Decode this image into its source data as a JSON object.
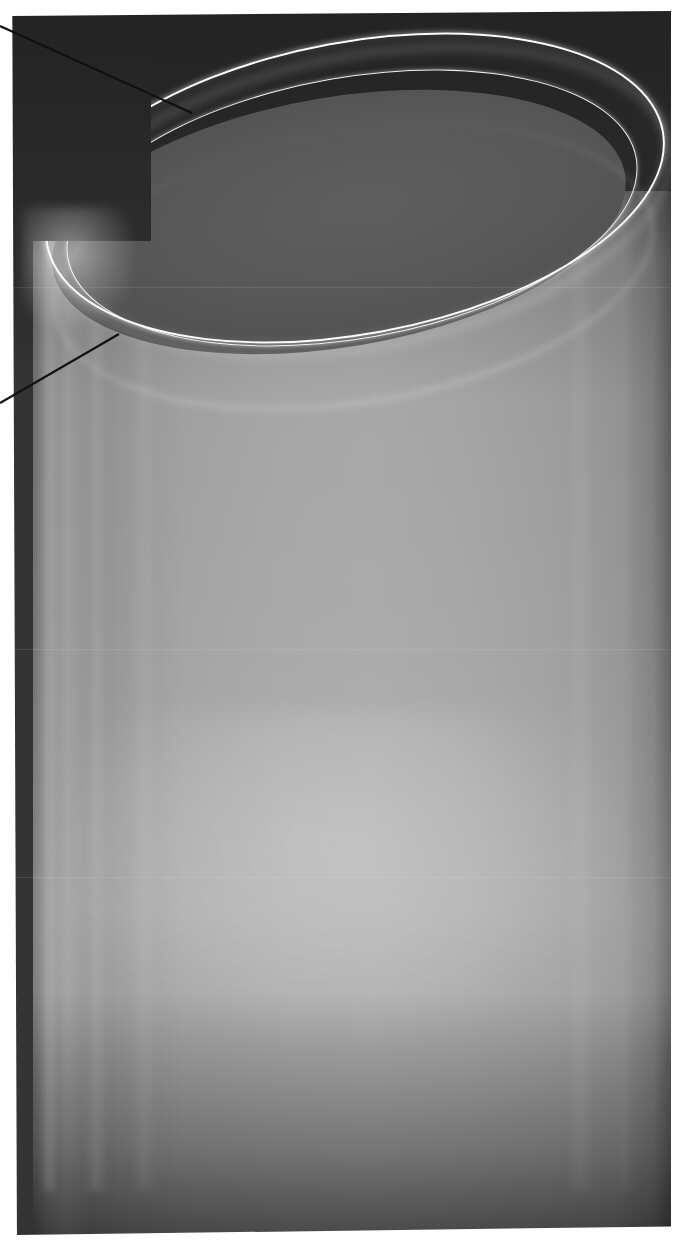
{
  "figure": {
    "kind": "grayscale-photograph",
    "caption": "",
    "orientation": "portrait",
    "width_px": 679,
    "height_px": 1245
  },
  "photo": {
    "plate": {
      "left_px": 11,
      "top_px": 11,
      "width_px": 660,
      "height_px": 1224,
      "page_background": "#ffffff"
    },
    "palette": {
      "page_white": "#ffffff",
      "backdrop_dark": "#232323",
      "backdrop_upper": "#2b2b2b",
      "vessel_interior": "#585858",
      "vessel_wall_mid": "#a6a6a6",
      "vessel_wall_edge_dark": "#5c5c5c",
      "rim_highlight": "#fdfdfd",
      "base_shadow": "#2e2e2e",
      "annotation_line": "#111111"
    },
    "regions": [
      {
        "name": "dark-backdrop",
        "description": "unlit background above and around the vessel mouth"
      },
      {
        "name": "vessel-mouth",
        "description": "elliptical opening tilted about -10 degrees"
      },
      {
        "name": "rim-outer-highlight",
        "description": "bright specular line tracing the outer lip"
      },
      {
        "name": "rim-inner-highlight",
        "description": "second bright line tracing the inner lip"
      },
      {
        "name": "inner-wall-far",
        "description": "faint arc of the far inner wall below the rim"
      },
      {
        "name": "cylinder-barrel",
        "description": "vertical translucent wall with soft vertical reflection streaks"
      },
      {
        "name": "base-shadow",
        "description": "darkened band toward the bottom of the vessel"
      }
    ]
  },
  "annotations": {
    "leaders": [
      {
        "id": "leader-rim",
        "target": "rim-outer-highlight",
        "label": "",
        "from": {
          "x": 0,
          "y": 26
        },
        "to": {
          "x": 192,
          "y": 113
        },
        "color": "#111111",
        "width_px": 2.1
      },
      {
        "id": "leader-wall",
        "target": "cylinder-barrel",
        "label": "",
        "from": {
          "x": 0,
          "y": 403
        },
        "to": {
          "x": 119,
          "y": 334
        },
        "color": "#111111",
        "width_px": 2.1
      }
    ],
    "count": 2
  }
}
